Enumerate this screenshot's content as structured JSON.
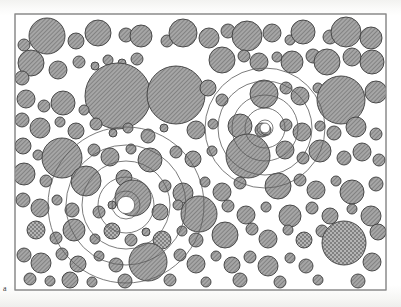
{
  "figure": {
    "panel_label": "a",
    "caption_label": "a",
    "type": "circle-packing-micrograph",
    "colors": {
      "background": "#ffffff",
      "paper_tone": "#f7f7f5",
      "circle_fill": "#9a9a9a",
      "circle_hatch": "#6e6e6e",
      "circle_stroke": "#3c3c3c",
      "ring_stroke": "#5a5a5a",
      "frame_stroke": "#8a8a8a",
      "label_color": "#3a3a3a"
    },
    "frame": {
      "x": 15,
      "y": 14,
      "width": 371,
      "height": 276,
      "stroke_width": 1
    },
    "hatch": {
      "angle_deg": 45,
      "spacing_px": 2,
      "line_width": 0.7
    }
  },
  "chart_data": {
    "type": "scatter",
    "title": "",
    "xlabel": "",
    "ylabel": "",
    "xlim": [
      15,
      386
    ],
    "ylim": [
      14,
      290
    ],
    "grid": false,
    "legend": null,
    "series": [
      {
        "name": "particles",
        "encoding": [
          "cx",
          "cy",
          "r",
          "texture"
        ],
        "textures": {
          "h": "diagonal-hatch",
          "s": "stipple-crosshatch"
        },
        "values": [
          [
            47,
            36,
            18,
            "h"
          ],
          [
            76,
            41,
            8,
            "h"
          ],
          [
            98,
            33,
            13,
            "h"
          ],
          [
            126,
            35,
            7,
            "h"
          ],
          [
            141,
            36,
            11,
            "h"
          ],
          [
            167,
            41,
            6,
            "h"
          ],
          [
            183,
            33,
            14,
            "h"
          ],
          [
            209,
            38,
            10,
            "h"
          ],
          [
            228,
            31,
            7,
            "h"
          ],
          [
            247,
            36,
            15,
            "h"
          ],
          [
            272,
            33,
            9,
            "h"
          ],
          [
            290,
            40,
            5,
            "h"
          ],
          [
            303,
            32,
            12,
            "h"
          ],
          [
            330,
            37,
            7,
            "h"
          ],
          [
            346,
            32,
            15,
            "h"
          ],
          [
            371,
            38,
            11,
            "h"
          ],
          [
            24,
            45,
            6,
            "h"
          ],
          [
            31,
            63,
            13,
            "h"
          ],
          [
            58,
            70,
            9,
            "h"
          ],
          [
            22,
            78,
            7,
            "h"
          ],
          [
            79,
            62,
            6,
            "h"
          ],
          [
            95,
            66,
            4,
            "h"
          ],
          [
            108,
            60,
            5,
            "h"
          ],
          [
            122,
            63,
            4,
            "h"
          ],
          [
            137,
            59,
            6,
            "h"
          ],
          [
            118,
            96,
            33,
            "h"
          ],
          [
            176,
            95,
            29,
            "h"
          ],
          [
            222,
            60,
            13,
            "h"
          ],
          [
            244,
            56,
            6,
            "h"
          ],
          [
            259,
            62,
            9,
            "h"
          ],
          [
            277,
            57,
            5,
            "h"
          ],
          [
            292,
            62,
            11,
            "h"
          ],
          [
            313,
            56,
            7,
            "h"
          ],
          [
            327,
            62,
            13,
            "h"
          ],
          [
            352,
            57,
            9,
            "h"
          ],
          [
            372,
            62,
            12,
            "h"
          ],
          [
            26,
            99,
            9,
            "h"
          ],
          [
            44,
            106,
            6,
            "h"
          ],
          [
            63,
            103,
            12,
            "h"
          ],
          [
            84,
            110,
            5,
            "h"
          ],
          [
            208,
            88,
            8,
            "h"
          ],
          [
            222,
            100,
            6,
            "h"
          ],
          [
            264,
            94,
            14,
            "h"
          ],
          [
            286,
            88,
            6,
            "h"
          ],
          [
            300,
            96,
            9,
            "h"
          ],
          [
            318,
            88,
            5,
            "h"
          ],
          [
            341,
            100,
            24,
            "h"
          ],
          [
            376,
            92,
            11,
            "h"
          ],
          [
            22,
            120,
            7,
            "h"
          ],
          [
            40,
            128,
            10,
            "h"
          ],
          [
            60,
            122,
            5,
            "h"
          ],
          [
            76,
            131,
            8,
            "h"
          ],
          [
            96,
            124,
            6,
            "h"
          ],
          [
            113,
            133,
            4,
            "h"
          ],
          [
            128,
            128,
            5,
            "h"
          ],
          [
            148,
            136,
            7,
            "h"
          ],
          [
            164,
            128,
            4,
            "h"
          ],
          [
            196,
            130,
            9,
            "h"
          ],
          [
            213,
            124,
            5,
            "h"
          ],
          [
            240,
            126,
            12,
            "h"
          ],
          [
            262,
            130,
            7,
            "h"
          ],
          [
            266,
            130,
            5,
            "h"
          ],
          [
            286,
            125,
            6,
            "h"
          ],
          [
            302,
            132,
            9,
            "h"
          ],
          [
            320,
            126,
            5,
            "h"
          ],
          [
            334,
            133,
            7,
            "h"
          ],
          [
            356,
            127,
            10,
            "h"
          ],
          [
            376,
            134,
            6,
            "h"
          ],
          [
            23,
            146,
            8,
            "h"
          ],
          [
            38,
            155,
            5,
            "h"
          ],
          [
            62,
            158,
            20,
            "h"
          ],
          [
            94,
            150,
            6,
            "h"
          ],
          [
            110,
            157,
            9,
            "h"
          ],
          [
            131,
            149,
            5,
            "h"
          ],
          [
            150,
            160,
            12,
            "h"
          ],
          [
            176,
            152,
            6,
            "h"
          ],
          [
            193,
            159,
            8,
            "h"
          ],
          [
            212,
            151,
            5,
            "h"
          ],
          [
            248,
            156,
            22,
            "h"
          ],
          [
            285,
            150,
            9,
            "h"
          ],
          [
            303,
            158,
            6,
            "h"
          ],
          [
            320,
            151,
            11,
            "h"
          ],
          [
            344,
            158,
            7,
            "h"
          ],
          [
            362,
            152,
            9,
            "h"
          ],
          [
            379,
            160,
            6,
            "h"
          ],
          [
            24,
            174,
            11,
            "h"
          ],
          [
            46,
            181,
            6,
            "h"
          ],
          [
            86,
            181,
            15,
            "h"
          ],
          [
            124,
            178,
            8,
            "h"
          ],
          [
            133,
            198,
            18,
            "h"
          ],
          [
            165,
            186,
            6,
            "h"
          ],
          [
            183,
            193,
            10,
            "h"
          ],
          [
            205,
            182,
            5,
            "h"
          ],
          [
            222,
            192,
            9,
            "h"
          ],
          [
            240,
            183,
            6,
            "h"
          ],
          [
            278,
            186,
            13,
            "h"
          ],
          [
            300,
            180,
            6,
            "h"
          ],
          [
            316,
            190,
            9,
            "h"
          ],
          [
            336,
            181,
            5,
            "h"
          ],
          [
            352,
            192,
            12,
            "h"
          ],
          [
            376,
            184,
            7,
            "h"
          ],
          [
            23,
            200,
            7,
            "h"
          ],
          [
            40,
            208,
            9,
            "h"
          ],
          [
            57,
            200,
            5,
            "h"
          ],
          [
            72,
            210,
            7,
            "h"
          ],
          [
            99,
            212,
            6,
            "h"
          ],
          [
            112,
            205,
            4,
            "h"
          ],
          [
            160,
            212,
            8,
            "h"
          ],
          [
            178,
            205,
            5,
            "h"
          ],
          [
            199,
            214,
            18,
            "h"
          ],
          [
            228,
            206,
            6,
            "h"
          ],
          [
            246,
            215,
            9,
            "h"
          ],
          [
            266,
            207,
            5,
            "h"
          ],
          [
            290,
            216,
            11,
            "h"
          ],
          [
            312,
            208,
            6,
            "h"
          ],
          [
            330,
            216,
            8,
            "h"
          ],
          [
            352,
            209,
            5,
            "h"
          ],
          [
            371,
            216,
            10,
            "h"
          ],
          [
            36,
            230,
            9,
            "s"
          ],
          [
            56,
            238,
            6,
            "h"
          ],
          [
            74,
            230,
            11,
            "h"
          ],
          [
            95,
            239,
            5,
            "h"
          ],
          [
            112,
            231,
            8,
            "s"
          ],
          [
            131,
            240,
            6,
            "h"
          ],
          [
            146,
            232,
            4,
            "h"
          ],
          [
            162,
            240,
            9,
            "s"
          ],
          [
            182,
            231,
            5,
            "h"
          ],
          [
            196,
            240,
            7,
            "h"
          ],
          [
            225,
            235,
            13,
            "h"
          ],
          [
            252,
            229,
            6,
            "h"
          ],
          [
            268,
            239,
            9,
            "h"
          ],
          [
            288,
            230,
            5,
            "h"
          ],
          [
            304,
            240,
            8,
            "s"
          ],
          [
            322,
            231,
            6,
            "h"
          ],
          [
            344,
            243,
            22,
            "s"
          ],
          [
            378,
            232,
            8,
            "h"
          ],
          [
            24,
            255,
            7,
            "h"
          ],
          [
            41,
            263,
            10,
            "h"
          ],
          [
            62,
            254,
            6,
            "h"
          ],
          [
            78,
            264,
            8,
            "h"
          ],
          [
            99,
            256,
            5,
            "h"
          ],
          [
            116,
            265,
            7,
            "h"
          ],
          [
            148,
            262,
            19,
            "h"
          ],
          [
            180,
            255,
            6,
            "h"
          ],
          [
            196,
            264,
            9,
            "h"
          ],
          [
            216,
            256,
            5,
            "h"
          ],
          [
            232,
            265,
            8,
            "h"
          ],
          [
            250,
            257,
            6,
            "h"
          ],
          [
            268,
            266,
            10,
            "h"
          ],
          [
            290,
            258,
            5,
            "h"
          ],
          [
            306,
            266,
            7,
            "h"
          ],
          [
            372,
            262,
            9,
            "h"
          ],
          [
            30,
            279,
            6,
            "h"
          ],
          [
            50,
            281,
            5,
            "h"
          ],
          [
            70,
            280,
            8,
            "h"
          ],
          [
            92,
            282,
            5,
            "h"
          ],
          [
            125,
            281,
            7,
            "h"
          ],
          [
            170,
            280,
            6,
            "h"
          ],
          [
            206,
            282,
            5,
            "h"
          ],
          [
            240,
            280,
            7,
            "h"
          ],
          [
            280,
            282,
            6,
            "h"
          ],
          [
            318,
            280,
            5,
            "h"
          ],
          [
            358,
            281,
            7,
            "h"
          ]
        ]
      },
      {
        "name": "concentric-rings-upper-right",
        "encoding": [
          "cx",
          "cy",
          "radii"
        ],
        "center": [
          265,
          128
        ],
        "radii": [
          8,
          20,
          33,
          47,
          60
        ]
      },
      {
        "name": "concentric-rings-lower-left",
        "encoding": [
          "cx",
          "cy",
          "radii"
        ],
        "center": [
          126,
          205
        ],
        "radii": [
          14,
          28,
          44,
          60,
          78
        ]
      }
    ]
  }
}
